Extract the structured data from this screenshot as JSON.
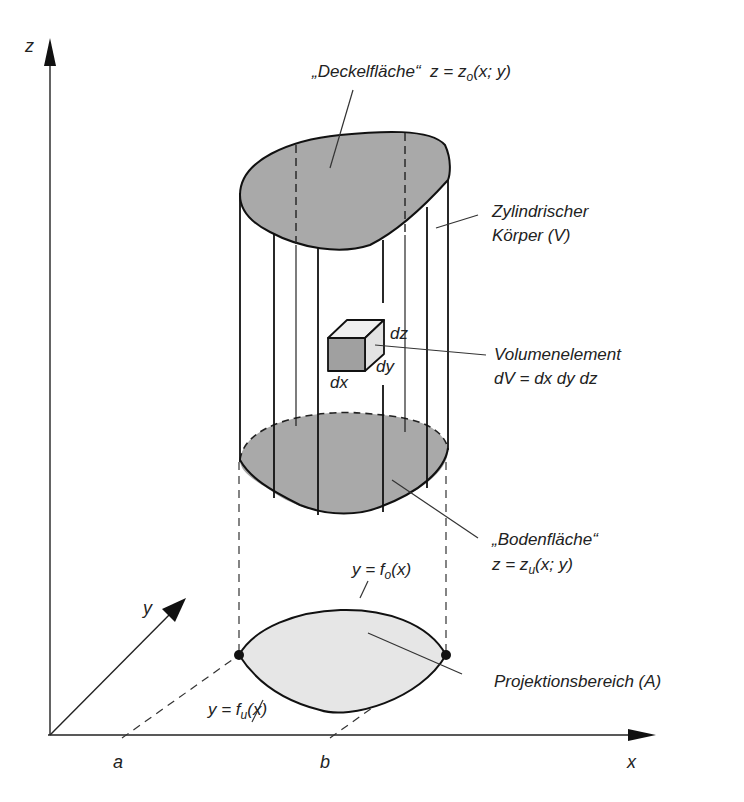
{
  "diagram": {
    "axes": {
      "z_label": "z",
      "y_label": "y",
      "x_label": "x",
      "x_marks": [
        "a",
        "b"
      ]
    },
    "annotations": {
      "top_surface_name": "„Deckelfläche“",
      "top_surface_eq_prefix": "z = z",
      "top_surface_eq_sub": "o",
      "top_surface_eq_suffix": "(x; y)",
      "body_line1": "Zylindrischer",
      "body_line2": "Körper (V)",
      "volume_element_name": "Volumenelement",
      "volume_element_eq": "dV = dx dy dz",
      "cube_dx": "dx",
      "cube_dy": "dy",
      "cube_dz": "dz",
      "bottom_surface_name": "„Bodenfläche“",
      "bottom_surface_eq_prefix": "z = z",
      "bottom_surface_eq_sub": "u",
      "bottom_surface_eq_suffix": "(x; y)",
      "upper_boundary_prefix": "y = f",
      "upper_boundary_sub": "o",
      "upper_boundary_suffix": "(x)",
      "lower_boundary_prefix": "y = f",
      "lower_boundary_sub": "u",
      "lower_boundary_suffix": "(x)",
      "projection_name": "Projektionsbereich (A)"
    },
    "colors": {
      "line": "#1a1a1a",
      "cap_fill": "#a9a9a9",
      "cube_front": "#a0a0a0",
      "cube_top": "#efefef",
      "cube_side": "#e2e2e2",
      "projection_fill": "#e6e6e6"
    }
  }
}
